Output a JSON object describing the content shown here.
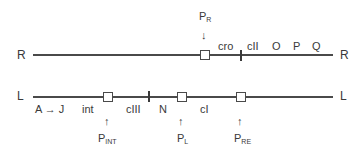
{
  "diagram": {
    "strands": {
      "rightward": {
        "left_label": "R",
        "right_label": "R"
      },
      "leftward": {
        "left_label": "L",
        "right_label": "L"
      }
    },
    "r_strand": {
      "promoter": {
        "main": "P",
        "sub": "R",
        "arrow": "↓"
      },
      "genes": [
        "cro",
        "cII",
        "O",
        "P",
        "Q"
      ]
    },
    "l_strand": {
      "genes": [
        "A → J",
        "int",
        "cIII",
        "N",
        "cI"
      ],
      "promoters": [
        {
          "main": "P",
          "sub": "INT",
          "arrow": "↑"
        },
        {
          "main": "P",
          "sub": "L",
          "arrow": "↑"
        },
        {
          "main": "P",
          "sub": "RE",
          "arrow": "↑"
        }
      ]
    }
  }
}
